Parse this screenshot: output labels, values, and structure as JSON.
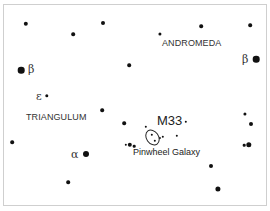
{
  "chart": {
    "constellations": [
      {
        "name": "ANDROMEDA",
        "x": 162,
        "y": 39
      },
      {
        "name": "TRIANGULUM",
        "x": 26,
        "y": 113
      }
    ],
    "greek_labels": [
      {
        "symbol": "β",
        "x": 29,
        "y": 65,
        "star": "beta-trianguli"
      },
      {
        "symbol": "β",
        "x": 242,
        "y": 55,
        "star": "beta-andromedae"
      },
      {
        "symbol": "ε",
        "x": 37,
        "y": 91,
        "star": "epsilon-trianguli"
      },
      {
        "symbol": "α",
        "x": 72,
        "y": 149,
        "star": "alpha-trianguli"
      }
    ],
    "object": {
      "id": "M33",
      "name": "Pinwheel Galaxy"
    },
    "stars": [
      {
        "x": 26,
        "y": 24,
        "r": 2.2
      },
      {
        "x": 103,
        "y": 23,
        "r": 2
      },
      {
        "x": 73,
        "y": 34,
        "r": 1.8
      },
      {
        "x": 201,
        "y": 26,
        "r": 1.8
      },
      {
        "x": 250,
        "y": 25,
        "r": 1.8
      },
      {
        "x": 160,
        "y": 34,
        "r": 1.6
      },
      {
        "x": 129,
        "y": 65,
        "r": 1.8
      },
      {
        "x": 21,
        "y": 70,
        "r": 3.3
      },
      {
        "x": 256,
        "y": 59,
        "r": 3.3
      },
      {
        "x": 47,
        "y": 96,
        "r": 1.7
      },
      {
        "x": 102,
        "y": 110,
        "r": 1.8
      },
      {
        "x": 12,
        "y": 142,
        "r": 1.8
      },
      {
        "x": 86,
        "y": 154,
        "r": 3
      },
      {
        "x": 124,
        "y": 123,
        "r": 1.8
      },
      {
        "x": 68,
        "y": 182,
        "r": 1.8
      },
      {
        "x": 245,
        "y": 114,
        "r": 1.6
      },
      {
        "x": 251,
        "y": 124,
        "r": 2
      },
      {
        "x": 244,
        "y": 145,
        "r": 1.3
      },
      {
        "x": 249,
        "y": 145,
        "r": 2.7
      },
      {
        "x": 211,
        "y": 166,
        "r": 2
      },
      {
        "x": 218,
        "y": 189,
        "r": 2.6
      },
      {
        "x": 126,
        "y": 145,
        "r": 1.2
      },
      {
        "x": 130,
        "y": 145,
        "r": 2.2
      },
      {
        "x": 134,
        "y": 146,
        "r": 1.3
      },
      {
        "x": 186,
        "y": 122,
        "r": 1.2
      },
      {
        "x": 146,
        "y": 127,
        "r": 1.2
      },
      {
        "x": 152,
        "y": 135,
        "r": 1.2
      },
      {
        "x": 163,
        "y": 137,
        "r": 1.2
      },
      {
        "x": 160,
        "y": 138,
        "r": 1.1
      },
      {
        "x": 177,
        "y": 136,
        "r": 1.2
      },
      {
        "x": 155,
        "y": 141,
        "r": 1.2
      }
    ]
  }
}
